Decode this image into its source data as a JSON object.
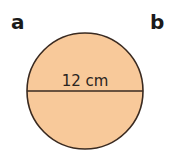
{
  "labels": {
    "a": "a",
    "b": "b"
  },
  "circle": {
    "shape": "circle",
    "fill_color": "#f8c99a",
    "stroke_color": "#3a2a20",
    "diameter_label": "12 cm",
    "measurement": "diameter"
  }
}
